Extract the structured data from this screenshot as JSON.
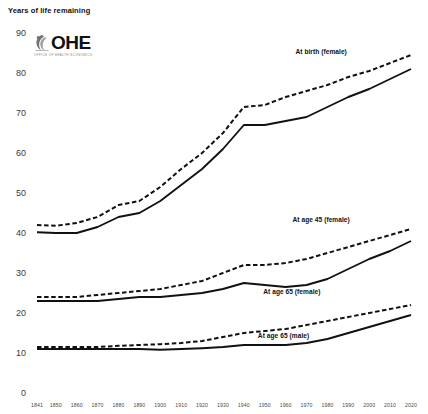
{
  "chart_data": {
    "type": "line",
    "title": "",
    "ylabel": "Years of life remaining",
    "xlabel": "",
    "ylim": [
      0,
      90
    ],
    "yticks": [
      0,
      10,
      20,
      30,
      40,
      50,
      60,
      70,
      80,
      90
    ],
    "xlim": [
      1841,
      2020
    ],
    "xticks": [
      1841,
      1850,
      1860,
      1870,
      1880,
      1890,
      1900,
      1910,
      1920,
      1930,
      1940,
      1950,
      1960,
      1970,
      1980,
      1990,
      2000,
      2010,
      2020
    ],
    "grid": false,
    "legend_position": "inline-annotations",
    "x": [
      1841,
      1850,
      1860,
      1870,
      1880,
      1890,
      1900,
      1910,
      1920,
      1930,
      1940,
      1950,
      1960,
      1970,
      1980,
      1990,
      2000,
      2010,
      2020
    ],
    "series": [
      {
        "name": "At birth (female)",
        "style": "dashed",
        "color": "#111111",
        "values": [
          42.0,
          41.8,
          42.5,
          44.0,
          47.0,
          48.0,
          51.5,
          56.0,
          60.0,
          65.0,
          71.5,
          72.0,
          74.0,
          75.5,
          77.0,
          79.0,
          80.5,
          82.5,
          84.5
        ]
      },
      {
        "name": "At birth (male)",
        "style": "solid",
        "color": "#111111",
        "values": [
          40.2,
          40.0,
          40.0,
          41.5,
          44.0,
          45.0,
          48.0,
          52.0,
          56.0,
          61.0,
          67.0,
          67.0,
          68.0,
          69.0,
          71.5,
          74.0,
          76.0,
          78.5,
          81.0
        ]
      },
      {
        "name": "At age 45 (female)",
        "style": "dashed",
        "color": "#111111",
        "values": [
          24.0,
          24.0,
          24.0,
          24.5,
          25.0,
          25.5,
          26.0,
          27.0,
          28.0,
          30.0,
          32.0,
          32.0,
          32.5,
          33.5,
          35.0,
          36.5,
          38.0,
          39.5,
          41.0
        ]
      },
      {
        "name": "At age 45 (male)",
        "style": "solid",
        "color": "#111111",
        "values": [
          23.0,
          23.0,
          23.0,
          23.0,
          23.5,
          24.0,
          24.0,
          24.5,
          25.0,
          26.0,
          27.5,
          27.0,
          26.5,
          27.0,
          28.5,
          31.0,
          33.5,
          35.5,
          38.0
        ]
      },
      {
        "name": "At age 65 (female)",
        "style": "dashed",
        "color": "#111111",
        "values": [
          11.5,
          11.5,
          11.5,
          11.5,
          11.8,
          12.0,
          12.2,
          12.5,
          13.0,
          14.0,
          15.0,
          15.5,
          16.0,
          17.0,
          18.0,
          19.0,
          20.0,
          21.0,
          22.0
        ]
      },
      {
        "name": "At age 65 (male)",
        "style": "solid",
        "color": "#111111",
        "values": [
          11.0,
          11.0,
          11.0,
          11.0,
          11.0,
          11.0,
          10.8,
          11.0,
          11.2,
          11.5,
          12.0,
          12.0,
          12.0,
          12.5,
          13.5,
          15.0,
          16.5,
          18.0,
          19.5
        ]
      }
    ],
    "annotations": [
      {
        "text": "At birth (female)",
        "x": 1977,
        "y": 85.0
      },
      {
        "text": "At age 45 (female)",
        "x": 1977,
        "y": 43.0
      },
      {
        "text": "At age 65 (female)",
        "x": 1963,
        "y": 25.0
      },
      {
        "text": "At age 65 (male)",
        "x": 1959,
        "y": 14.0
      }
    ]
  },
  "logo": {
    "name": "OHE",
    "tagline": "OFFICE OF HEALTH ECONOMICS"
  },
  "axis": {
    "y_title": "Years of life remaining"
  }
}
